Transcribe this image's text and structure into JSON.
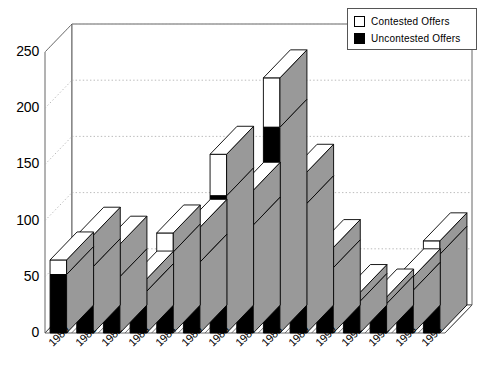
{
  "chart_data": {
    "type": "bar",
    "subtype": "stacked-3d-column",
    "title": "",
    "xlabel": "",
    "ylabel": "",
    "categories": [
      "1980",
      "1981",
      "1982",
      "1983",
      "1984",
      "1985",
      "1986",
      "1987",
      "1988",
      "1989",
      "1990",
      "1991",
      "1992",
      "1993",
      "1994"
    ],
    "series": [
      {
        "name": "Uncontested Offers",
        "color": "#000000",
        "values": [
          52,
          59,
          50,
          37,
          72,
          63,
          122,
          96,
          183,
          115,
          58,
          28,
          26,
          38,
          70
        ]
      },
      {
        "name": "Contested Offers",
        "color": "#FFFFFF",
        "values": [
          13,
          28,
          29,
          11,
          17,
          31,
          37,
          31,
          44,
          28,
          18,
          8,
          6,
          12,
          12
        ]
      }
    ],
    "totals": [
      65,
      87,
      79,
      48,
      89,
      94,
      159,
      127,
      227,
      143,
      76,
      36,
      32,
      50,
      82
    ],
    "ylim": [
      0,
      250
    ],
    "yticks": [
      0,
      50,
      100,
      150,
      200,
      250
    ],
    "ytick_labels": [
      "0",
      "50",
      "100",
      "150",
      "200",
      "250"
    ],
    "grid": true,
    "grid_style": "dotted-horizontal-backwall",
    "legend_position": "top-right",
    "stacking_order": [
      "Uncontested Offers",
      "Contested Offers"
    ]
  },
  "legend": {
    "entries": [
      {
        "label": "Contested Offers",
        "swatch": "#FFFFFF"
      },
      {
        "label": "Uncontested Offers",
        "swatch": "#000000"
      }
    ]
  },
  "axes": {
    "y_tick_labels": [
      "250",
      "200",
      "150",
      "100",
      "50",
      "0"
    ],
    "x_tick_labels": [
      "1980",
      "1981",
      "1982",
      "1983",
      "1984",
      "1985",
      "1986",
      "1987",
      "1988",
      "1989",
      "1990",
      "1991",
      "1992",
      "1993",
      "1994"
    ]
  },
  "style": {
    "bar_front_uncontested": "#000000",
    "bar_front_contested": "#FFFFFF",
    "bar_side": "#999999",
    "bar_top": "#FFFFFF",
    "outline": "#000000",
    "grid_color": "#AAAAAA",
    "axis_color": "#555555",
    "background": "#FFFFFF"
  }
}
